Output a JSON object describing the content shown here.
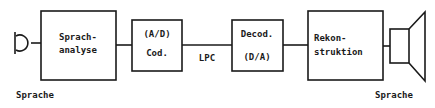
{
  "diagram": {
    "input_label": "Sprache",
    "output_label": "Sprache",
    "channel_label": "LPC",
    "blocks": [
      {
        "line1": "Sprach-",
        "line2": "analyse"
      },
      {
        "line1": "(A/D)",
        "line2": "Cod."
      },
      {
        "line1": "Decod.",
        "line2": "(D/A)"
      },
      {
        "line1": "Rekon-",
        "line2": "struktion"
      }
    ],
    "colors": {
      "stroke": "#1a1a1a",
      "background": "#ffffff"
    }
  }
}
